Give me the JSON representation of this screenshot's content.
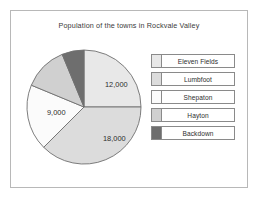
{
  "chart_data": {
    "type": "pie",
    "title": "Population of the towns in Rockvale Valley",
    "categories": [
      "Eleven Fields",
      "Lumbfoot",
      "Shepaton",
      "Hayton",
      "Backdown"
    ],
    "values": [
      12000,
      18000,
      9000,
      6000,
      3000
    ],
    "labels_shown": [
      "12,000",
      "18,000",
      "9,000",
      "",
      ""
    ],
    "total": 48000,
    "angles_deg": [
      90,
      135,
      67.5,
      45,
      22.5
    ],
    "colors": [
      "#e8e8e8",
      "#dcdcdc",
      "#fbfbfb",
      "#d0d0d0",
      "#6e6e6e"
    ],
    "legend_position": "right",
    "grid": false,
    "xlabel": "",
    "ylabel": ""
  },
  "card": {
    "border_color": "#b8b8b8",
    "background": "#ffffff"
  },
  "slice_labels": [
    {
      "text": "12,000",
      "x": 82,
      "y": 48
    },
    {
      "text": "18,000",
      "x": 80,
      "y": 102
    },
    {
      "text": "9,000",
      "x": 24,
      "y": 76
    }
  ],
  "legend": {
    "items": [
      {
        "label": "Eleven Fields",
        "color": "#e8e8e8"
      },
      {
        "label": "Lumbfoot",
        "color": "#dcdcdc"
      },
      {
        "label": "Shepaton",
        "color": "#fbfbfb"
      },
      {
        "label": "Hayton",
        "color": "#d0d0d0"
      },
      {
        "label": "Backdown",
        "color": "#6e6e6e"
      }
    ]
  }
}
